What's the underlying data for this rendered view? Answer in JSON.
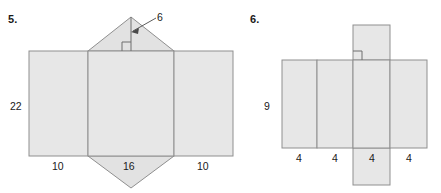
{
  "problems": [
    {
      "number": "5.",
      "figure": "net-of-triangular-prism",
      "dimensions": {
        "height": "22",
        "base_left": "10",
        "base_middle": "16",
        "base_right": "10",
        "triangle_height": "6"
      },
      "labels": {
        "height_label": "22",
        "left_width_label": "10",
        "middle_width_label": "16",
        "right_width_label": "10",
        "altitude_label": "6"
      }
    },
    {
      "number": "6.",
      "figure": "net-of-rectangular-prism",
      "dimensions": {
        "height": "9",
        "width_1": "4",
        "width_2": "4",
        "width_3": "4",
        "width_4": "4"
      },
      "labels": {
        "height_label": "9",
        "width_label_1": "4",
        "width_label_2": "4",
        "width_label_3": "4",
        "width_label_4": "4"
      }
    }
  ],
  "colors": {
    "face_fill": "#e7e7e7",
    "edge_stroke": "#8f8f8f",
    "text": "#1a1a1a",
    "background": "#ffffff"
  }
}
